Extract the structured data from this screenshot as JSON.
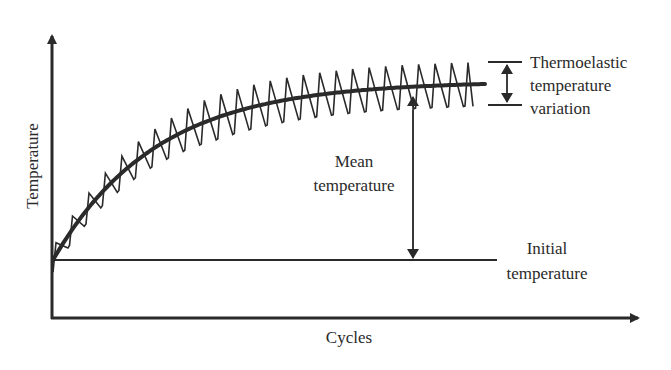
{
  "figure": {
    "type": "schematic"
  },
  "axes": {
    "x_label": "Cycles",
    "y_label": "Temperature"
  },
  "annotations": {
    "thermoelastic": {
      "line1": "Thermoelastic",
      "line2": "temperature",
      "line3": "variation"
    },
    "mean": {
      "line1": "Mean",
      "line2": "temperature"
    },
    "initial": {
      "line1": "Initial",
      "line2": "temperature"
    }
  },
  "curves": {
    "mean_curve": {
      "shape": "exponential rise to plateau",
      "teeth_count": 26
    },
    "oscillation": {
      "shape": "sawtooth around mean curve",
      "amplitude_px": 22
    }
  },
  "colors": {
    "stroke": "#2a2a2a",
    "background": "#ffffff"
  }
}
